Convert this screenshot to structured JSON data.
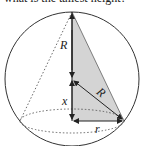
{
  "figure": {
    "top_text_cutoff": "what is the tallest height?",
    "labels": {
      "vertical_radius": "R",
      "slant_radius": "R",
      "height_offset": "x",
      "base_radius": "r"
    },
    "colors": {
      "stroke": "#222222",
      "shade": "#d4d4d4",
      "dotted": "#444444"
    }
  }
}
